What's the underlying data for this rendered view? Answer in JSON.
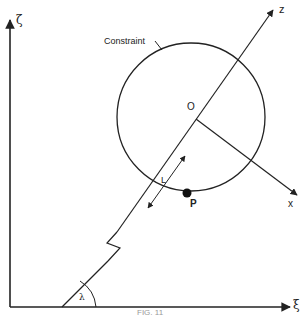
{
  "diagram": {
    "axes": {
      "vertical_label": "ζ",
      "horizontal_label": "ξ",
      "z_axis_label": "z",
      "x_axis_label": "x"
    },
    "labels": {
      "constraint": "Constraint",
      "origin": "O",
      "length": "L",
      "point": "P",
      "angle": "λ"
    },
    "caption": "FIG. 11",
    "colors": {
      "ink": "#222222",
      "background": "#ffffff"
    }
  }
}
